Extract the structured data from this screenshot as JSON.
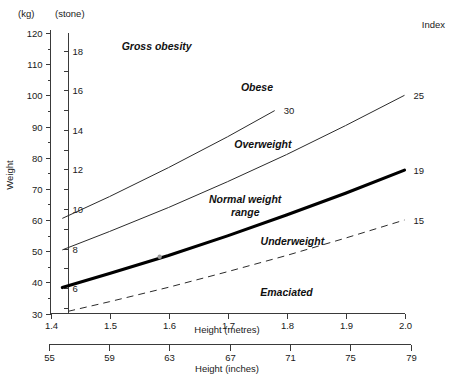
{
  "chart_data": {
    "type": "line",
    "title": "",
    "xlabel": "Height (metres)",
    "ylabel": "Weight",
    "xlim": [
      1.4,
      2.0
    ],
    "ylim": [
      30,
      120
    ],
    "grid": false,
    "legend_position": "right-edge-labels",
    "primary_x_axis": {
      "label": "Height (metres)",
      "ticks": [
        1.4,
        1.5,
        1.6,
        1.7,
        1.8,
        1.9,
        2.0
      ],
      "ticklabels": [
        "1.4",
        "1.5",
        "1.6",
        "1.7",
        "1.8",
        "1.9",
        "2.0"
      ]
    },
    "secondary_x_axis": {
      "label": "Height (inches)",
      "ticks": [
        55,
        59,
        63,
        67,
        71,
        75,
        79
      ],
      "ticklabels": [
        "55",
        "59",
        "63",
        "67",
        "71",
        "75",
        "79"
      ],
      "range": [
        55,
        79
      ]
    },
    "primary_y_axis": {
      "label": "Weight",
      "unit": "(kg)",
      "ticks": [
        30,
        40,
        50,
        60,
        70,
        80,
        90,
        100,
        110,
        120
      ],
      "ticklabels": [
        "30",
        "40",
        "50",
        "60",
        "70",
        "80",
        "90",
        "100",
        "110",
        "120"
      ],
      "minor_ticks": [
        35,
        45,
        55,
        65,
        75,
        85,
        95,
        105,
        115
      ]
    },
    "secondary_y_axis": {
      "label": "",
      "unit": "(stone)",
      "range": [
        5,
        19
      ],
      "ticks": [
        5,
        6,
        7,
        8,
        9,
        10,
        11,
        12,
        13,
        14,
        15,
        16,
        17,
        18,
        19
      ],
      "labeled_ticks": [
        6,
        8,
        10,
        12,
        14,
        16,
        18
      ],
      "ticklabels": [
        "6",
        "8",
        "10",
        "12",
        "14",
        "16",
        "18"
      ]
    },
    "index_axis_title": "Index",
    "series": [
      {
        "name": "BMI 30",
        "bmi": 30,
        "index_label": "30",
        "style": "thin",
        "x_start": 1.42,
        "x_end": 1.78,
        "points": [
          {
            "x": 1.42,
            "y": 60.5
          },
          {
            "x": 1.5,
            "y": 67.5
          },
          {
            "x": 1.6,
            "y": 76.8
          },
          {
            "x": 1.7,
            "y": 86.7
          },
          {
            "x": 1.78,
            "y": 95.1
          }
        ]
      },
      {
        "name": "BMI 25",
        "bmi": 25,
        "index_label": "25",
        "style": "thin",
        "x_start": 1.42,
        "x_end": 2.0,
        "points": [
          {
            "x": 1.42,
            "y": 50.4
          },
          {
            "x": 1.5,
            "y": 56.3
          },
          {
            "x": 1.6,
            "y": 64.0
          },
          {
            "x": 1.7,
            "y": 72.3
          },
          {
            "x": 1.8,
            "y": 81.0
          },
          {
            "x": 1.9,
            "y": 90.3
          },
          {
            "x": 2.0,
            "y": 100.0
          }
        ]
      },
      {
        "name": "BMI 19",
        "bmi": 19,
        "index_label": "19",
        "style": "bold",
        "x_start": 1.42,
        "x_end": 2.0,
        "points": [
          {
            "x": 1.42,
            "y": 38.3
          },
          {
            "x": 1.5,
            "y": 42.8
          },
          {
            "x": 1.6,
            "y": 48.6
          },
          {
            "x": 1.7,
            "y": 54.9
          },
          {
            "x": 1.8,
            "y": 61.6
          },
          {
            "x": 1.9,
            "y": 68.6
          },
          {
            "x": 2.0,
            "y": 76.0
          }
        ]
      },
      {
        "name": "BMI 15",
        "bmi": 15,
        "index_label": "15",
        "style": "dashed",
        "x_start": 1.43,
        "x_end": 2.0,
        "points": [
          {
            "x": 1.43,
            "y": 30.7
          },
          {
            "x": 1.5,
            "y": 33.8
          },
          {
            "x": 1.6,
            "y": 38.4
          },
          {
            "x": 1.7,
            "y": 43.4
          },
          {
            "x": 1.8,
            "y": 48.6
          },
          {
            "x": 1.9,
            "y": 54.2
          },
          {
            "x": 2.0,
            "y": 60.0
          }
        ]
      }
    ],
    "zone_annotations": [
      {
        "text": "Gross obesity",
        "x": 1.58,
        "y": 114.5
      },
      {
        "text": "Obese",
        "x": 1.75,
        "y": 101.5
      },
      {
        "text": "Overweight",
        "x": 1.76,
        "y": 83.0
      },
      {
        "text": "Normal weight",
        "x": 1.73,
        "y": 65.5
      },
      {
        "text": "range",
        "x": 1.73,
        "y": 61.2
      },
      {
        "text": "Underweight",
        "x": 1.81,
        "y": 52.0
      },
      {
        "text": "Emaciated",
        "x": 1.8,
        "y": 35.5
      }
    ],
    "marker_points": [
      {
        "x": 1.585,
        "y": 48.2
      }
    ],
    "colors": {
      "line": "#2b2b2b",
      "bold_line": "#000000",
      "axis": "#3a3a3a",
      "text": "#1a1a1a",
      "background": "#ffffff"
    }
  }
}
